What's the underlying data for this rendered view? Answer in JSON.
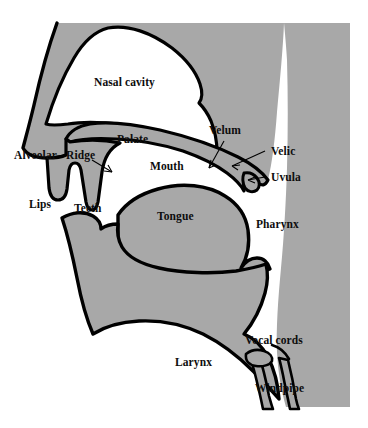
{
  "figure": {
    "colors": {
      "tissue_gray": "#a8a8a8",
      "airway_white": "#ffffff",
      "outline_black": "#000000",
      "background": "#ffffff",
      "label_text": "#0d0d0d"
    }
  },
  "labels": {
    "nasal_cavity": "Nasal cavity",
    "palate": "Palate",
    "velum": "Velum",
    "velic": "Velic",
    "uvula": "Uvula",
    "alveolar": "Alveolar",
    "ridge": "Ridge",
    "mouth": "Mouth",
    "lips": "Lips",
    "teeth": "Teeth",
    "tongue": "Tongue",
    "pharynx": "Pharynx",
    "vocal_cords": "Vocal cords",
    "larynx": "Larynx",
    "windpipe": "Windpipe"
  },
  "regions": [
    {
      "name": "nasal-cavity",
      "fill": "airway_white"
    },
    {
      "name": "oral-cavity-mouth",
      "fill": "airway_white"
    },
    {
      "name": "pharyngeal-cavity",
      "fill": "airway_white"
    },
    {
      "name": "head-tissue",
      "fill": "tissue_gray"
    },
    {
      "name": "velum-soft-palate",
      "fill": "tissue_gray"
    },
    {
      "name": "tongue-body",
      "fill": "tissue_gray"
    },
    {
      "name": "jaw-mandible",
      "fill": "tissue_gray"
    },
    {
      "name": "windpipe-trachea",
      "fill": "tissue_gray"
    }
  ]
}
